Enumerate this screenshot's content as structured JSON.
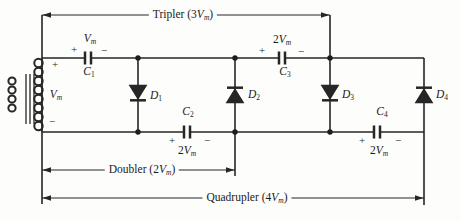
{
  "meta": {
    "figure_type": "circuit-diagram",
    "background": "#fdfdfc",
    "line_color": "#262626",
    "text_color": "#1b1b1b"
  },
  "dims": {
    "tripler": {
      "pre": "Tripler (3",
      "sym": "V",
      "sub": "m",
      "post": ")"
    },
    "doubler": {
      "pre": "Doubler (2",
      "sym": "V",
      "sub": "m",
      "post": ")"
    },
    "quadrupler": {
      "pre": "Quadrupler (4",
      "sym": "V",
      "sub": "m",
      "post": ")"
    }
  },
  "source": {
    "plus": "+",
    "minus": "−",
    "sym": "V",
    "sub": "m"
  },
  "caps": {
    "c1": {
      "name_sym": "C",
      "name_sub": "1",
      "val_pre": "",
      "val_sym": "V",
      "val_sub": "m",
      "plus": "+",
      "minus": "−"
    },
    "c2": {
      "name_sym": "C",
      "name_sub": "2",
      "val_pre": "2",
      "val_sym": "V",
      "val_sub": "m",
      "plus": "+",
      "minus": "−"
    },
    "c3": {
      "name_sym": "C",
      "name_sub": "3",
      "val_pre": "2",
      "val_sym": "V",
      "val_sub": "m",
      "plus": "+",
      "minus": "−"
    },
    "c4": {
      "name_sym": "C",
      "name_sub": "4",
      "val_pre": "2",
      "val_sym": "V",
      "val_sub": "m",
      "plus": "+",
      "minus": "−"
    }
  },
  "diodes": {
    "d1": {
      "sym": "D",
      "sub": "1"
    },
    "d2": {
      "sym": "D",
      "sub": "2"
    },
    "d3": {
      "sym": "D",
      "sub": "3"
    },
    "d4": {
      "sym": "D",
      "sub": "4"
    }
  }
}
